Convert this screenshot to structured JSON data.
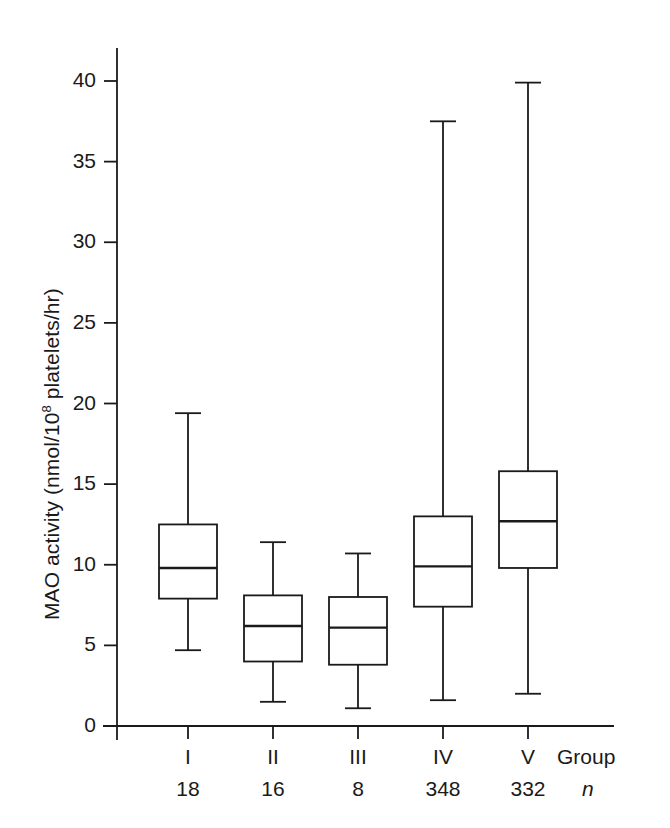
{
  "chart_data": {
    "type": "box",
    "title": "",
    "xlabel": "Group",
    "ylabel": "MAO activity (nmol/10⁸ platelets/hr)",
    "ylabel_parts": {
      "before": "MAO activity (nmol/10",
      "sup": "8",
      "after": " platelets/hr)"
    },
    "xaxis_corner_label": "Group",
    "n_corner_label": "n",
    "ylim": [
      0,
      43
    ],
    "yticks": [
      0,
      5,
      10,
      15,
      20,
      25,
      30,
      35,
      40
    ],
    "ytick_labels": [
      "0",
      "5",
      "10",
      "15",
      "20",
      "25",
      "30",
      "35",
      "40"
    ],
    "grid": false,
    "legend": "none",
    "categories": [
      "I",
      "II",
      "III",
      "IV",
      "V"
    ],
    "n": [
      18,
      16,
      8,
      348,
      332
    ],
    "n_labels": [
      "18",
      "16",
      "8",
      "348",
      "332"
    ],
    "boxes": [
      {
        "group": "I",
        "n": 18,
        "whisker_low": 4.7,
        "q1": 7.9,
        "median": 9.8,
        "q3": 12.5,
        "whisker_high": 19.4
      },
      {
        "group": "II",
        "n": 16,
        "whisker_low": 1.5,
        "q1": 4.0,
        "median": 6.2,
        "q3": 8.1,
        "whisker_high": 11.4
      },
      {
        "group": "III",
        "n": 8,
        "whisker_low": 1.1,
        "q1": 3.8,
        "median": 6.1,
        "q3": 8.0,
        "whisker_high": 10.7
      },
      {
        "group": "IV",
        "n": 348,
        "whisker_low": 1.6,
        "q1": 7.4,
        "median": 9.9,
        "q3": 13.0,
        "whisker_high": 37.5
      },
      {
        "group": "V",
        "n": 332,
        "whisker_low": 2.0,
        "q1": 9.8,
        "median": 12.7,
        "q3": 15.8,
        "whisker_high": 39.9
      }
    ],
    "colors": {
      "line": "#1a1a1a",
      "background": "#ffffff",
      "box_fill": "#ffffff"
    }
  }
}
